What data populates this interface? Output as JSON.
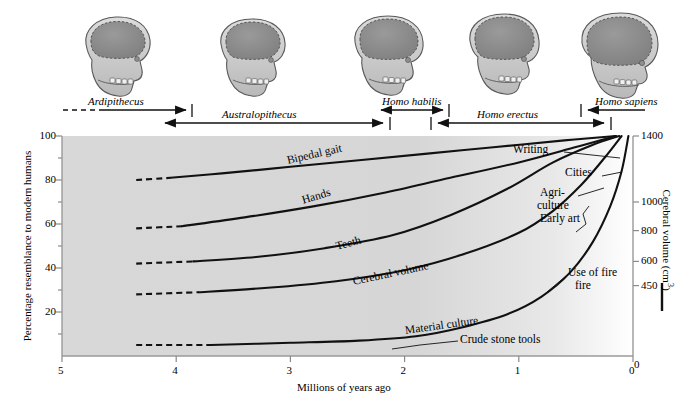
{
  "chart_data": {
    "type": "line",
    "title": "",
    "xlabel": "Millions of years ago",
    "ylabel": "Percentage resemblance to modern humans",
    "y2label": "Cerebral volume (cm3)",
    "y2label_display": "Cerebral volume (cm",
    "y2label_sup": "3",
    "y2label_tail": ")",
    "xlim": [
      5,
      0
    ],
    "ylim": [
      0,
      100
    ],
    "x_ticks": [
      "5",
      "4",
      "3",
      "2",
      "1",
      "0"
    ],
    "x_tick_values": [
      5,
      4,
      3,
      2,
      1,
      0
    ],
    "y_ticks": [
      "20",
      "40",
      "60",
      "80",
      "100"
    ],
    "y_tick_values": [
      20,
      40,
      60,
      80,
      100
    ],
    "y_minor_tick_values": [
      10,
      30,
      50,
      70,
      90
    ],
    "y2_ticks": [
      "450",
      "600",
      "800",
      "1000",
      "1400"
    ],
    "y2_tick_values": [
      450,
      600,
      800,
      1000,
      1400
    ],
    "y2_tick_percent_positions": [
      32,
      43,
      57,
      70,
      100
    ],
    "y2_zero_tick": "0",
    "grid": false,
    "legend_position": "inline-curve-labels",
    "background": "light gray gradient fading to white at right",
    "series": [
      {
        "name": "Bipedal gait",
        "label": "Bipedal gait",
        "dashed_start_x": 4.35,
        "dashed_end_x": 4.05,
        "points": [
          [
            4.35,
            80
          ],
          [
            4.05,
            81
          ],
          [
            3.6,
            83
          ],
          [
            3.0,
            86
          ],
          [
            2.4,
            89
          ],
          [
            1.8,
            92
          ],
          [
            1.2,
            95
          ],
          [
            0.6,
            98
          ],
          [
            0.15,
            100
          ]
        ]
      },
      {
        "name": "Hands",
        "label": "Hands",
        "dashed_start_x": 4.35,
        "dashed_end_x": 3.95,
        "points": [
          [
            4.35,
            58
          ],
          [
            3.95,
            59
          ],
          [
            3.4,
            63
          ],
          [
            2.8,
            68
          ],
          [
            2.2,
            74
          ],
          [
            1.6,
            81
          ],
          [
            1.0,
            88
          ],
          [
            0.5,
            95
          ],
          [
            0.15,
            100
          ]
        ]
      },
      {
        "name": "Teeth",
        "label": "Teeth",
        "dashed_start_x": 4.35,
        "dashed_end_x": 3.85,
        "points": [
          [
            4.35,
            42
          ],
          [
            3.85,
            43
          ],
          [
            3.3,
            45
          ],
          [
            2.7,
            49
          ],
          [
            2.1,
            55
          ],
          [
            1.6,
            64
          ],
          [
            1.1,
            76
          ],
          [
            0.7,
            88
          ],
          [
            0.35,
            96
          ],
          [
            0.12,
            100
          ]
        ]
      },
      {
        "name": "Cerebral volume",
        "label": "Cerebral volume",
        "dashed_start_x": 4.35,
        "dashed_end_x": 3.8,
        "points": [
          [
            4.35,
            28
          ],
          [
            3.8,
            29
          ],
          [
            3.2,
            31
          ],
          [
            2.6,
            34
          ],
          [
            2.0,
            39
          ],
          [
            1.5,
            46
          ],
          [
            1.0,
            56
          ],
          [
            0.7,
            66
          ],
          [
            0.45,
            78
          ],
          [
            0.25,
            90
          ],
          [
            0.1,
            100
          ]
        ]
      },
      {
        "name": "Material culture",
        "label": "Material culture",
        "dashed_start_x": 4.35,
        "dashed_end_x": 3.7,
        "points": [
          [
            4.35,
            5
          ],
          [
            3.7,
            5
          ],
          [
            3.0,
            6
          ],
          [
            2.4,
            7
          ],
          [
            1.9,
            9
          ],
          [
            1.5,
            13
          ],
          [
            1.1,
            19
          ],
          [
            0.8,
            27
          ],
          [
            0.55,
            38
          ],
          [
            0.35,
            52
          ],
          [
            0.2,
            68
          ],
          [
            0.1,
            84
          ],
          [
            0.04,
            100
          ]
        ]
      }
    ],
    "curve_labels": [
      {
        "text": "Bipedal gait",
        "x": 3.03,
        "y": 88
      },
      {
        "text": "Hands",
        "x": 2.9,
        "y": 70
      },
      {
        "text": "Teeth",
        "x": 2.6,
        "y": 49
      },
      {
        "text": "Cerebral volume",
        "x": 2.45,
        "y": 33
      },
      {
        "text": "Material culture",
        "x": 2.0,
        "y": 11
      }
    ],
    "annotations": [
      {
        "text": "Crude stone tools",
        "target_series": "Material culture"
      },
      {
        "text": "Use of fire",
        "target_series": "Material culture"
      },
      {
        "text": "Early art",
        "target_series": "Material culture"
      },
      {
        "text": "Agri-",
        "target_series": "Material culture"
      },
      {
        "text": "culture",
        "target_series": "Material culture"
      },
      {
        "text": "Cities",
        "target_series": "Material culture"
      },
      {
        "text": "Writing",
        "target_series": "Material culture"
      }
    ]
  },
  "species_timeline": [
    {
      "name": "Ardipithecus",
      "start": 5.0,
      "end": 3.85,
      "row": "upper",
      "leading_dashed": true
    },
    {
      "name": "Australopithecus",
      "start": 4.15,
      "end": 1.85,
      "row": "lower",
      "leading_dashed": false
    },
    {
      "name": "Homo habilis",
      "start": 2.1,
      "end": 1.4,
      "row": "upper",
      "leading_dashed": false
    },
    {
      "name": "Homo erectus",
      "start": 1.75,
      "end": 0.25,
      "row": "lower",
      "leading_dashed": false
    },
    {
      "name": "Homo sapiens",
      "start": 0.35,
      "end": 0.0,
      "row": "upper",
      "leading_dashed": false
    }
  ],
  "skulls": [
    {
      "species": "Ardipithecus",
      "cranium_size": "small",
      "x": 5.0
    },
    {
      "species": "Australopithecus",
      "cranium_size": "small-medium",
      "x": 3.3
    },
    {
      "species": "Homo habilis",
      "cranium_size": "medium",
      "x": 1.9
    },
    {
      "species": "Homo erectus",
      "cranium_size": "medium-large",
      "x": 1.0
    },
    {
      "species": "Homo sapiens",
      "cranium_size": "large",
      "x": 0.25
    }
  ],
  "colors": {
    "plot_background_left": "#d9d9d9",
    "plot_background_right": "#ffffff",
    "curve": "#111111",
    "axis": "#8a8a8a",
    "skull_bone": "#c9c9c9",
    "skull_cranium": "#8d8d8d",
    "text": "#101010"
  }
}
